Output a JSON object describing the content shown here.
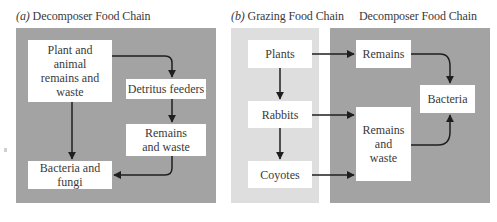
{
  "panel_a": {
    "label": "(a)",
    "title": "Decomposer Food Chain",
    "background": "#a3a3a3",
    "nodes": {
      "plant_remains": "Plant and animal remains and waste",
      "detritus_feeders": "Detritus feeders",
      "remains_waste": "Remains and waste",
      "bacteria_fungi": "Bacteria and fungi"
    },
    "edges": [
      [
        "Plant and animal remains and waste",
        "Detritus feeders"
      ],
      [
        "Detritus feeders",
        "Remains and waste"
      ],
      [
        "Remains and waste",
        "Bacteria and fungi"
      ],
      [
        "Plant and animal remains and waste",
        "Bacteria and fungi"
      ]
    ]
  },
  "panel_b": {
    "label": "(b)",
    "title": "Grazing Food Chain",
    "background": "#dedede",
    "nodes": {
      "plants": "Plants",
      "rabbits": "Rabbits",
      "coyotes": "Coyotes"
    }
  },
  "panel_c": {
    "title": "Decomposer Food Chain",
    "background": "#a3a3a3",
    "nodes": {
      "remains": "Remains",
      "remains_waste": "Remains and waste",
      "bacteria": "Bacteria"
    }
  },
  "panel_bc_edges": [
    [
      "Plants",
      "Rabbits"
    ],
    [
      "Rabbits",
      "Coyotes"
    ],
    [
      "Plants",
      "Remains"
    ],
    [
      "Rabbits",
      "Remains and waste"
    ],
    [
      "Coyotes",
      "Remains and waste"
    ],
    [
      "Remains",
      "Bacteria"
    ],
    [
      "Remains and waste",
      "Bacteria"
    ]
  ],
  "colors": {
    "dark_panel": "#a3a3a3",
    "light_panel": "#dedede",
    "box": "#ffffff",
    "arrow": "#1f1f1f",
    "text": "#3a3a3a"
  }
}
